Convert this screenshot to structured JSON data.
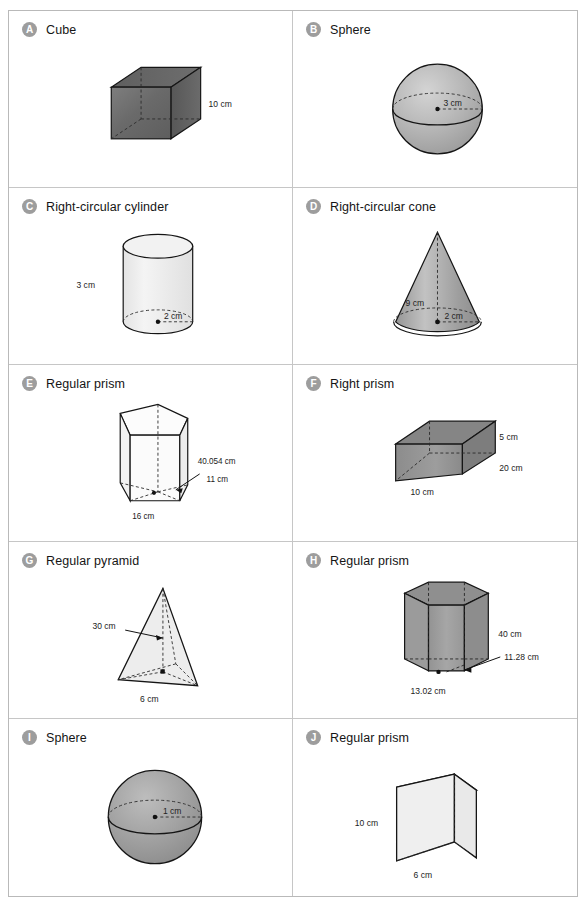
{
  "page": {
    "columns": 2,
    "rows": 5,
    "cell_count": 10
  },
  "cells": [
    {
      "badge": "A",
      "title": "Cube",
      "shape": "cube",
      "fill": "#6f6f6f",
      "labels": [
        {
          "name": "edge-length",
          "text": "10 cm"
        }
      ]
    },
    {
      "badge": "B",
      "title": "Sphere",
      "shape": "sphere",
      "fill": "#b0b0b0",
      "labels": [
        {
          "name": "radius",
          "text": "3 cm"
        }
      ]
    },
    {
      "badge": "C",
      "title": "Right-circular cylinder",
      "shape": "cylinder",
      "fill": "#f0f0f0",
      "labels": [
        {
          "name": "height",
          "text": "3 cm"
        },
        {
          "name": "radius",
          "text": "2 cm"
        }
      ]
    },
    {
      "badge": "D",
      "title": "Right-circular cone",
      "shape": "cone",
      "fill": "#a8a8a8",
      "labels": [
        {
          "name": "height",
          "text": "9 cm"
        },
        {
          "name": "radius",
          "text": "2 cm"
        }
      ]
    },
    {
      "badge": "E",
      "title": "Regular prism",
      "shape": "pentagonal-prism",
      "fill": "#fbfbfb",
      "labels": [
        {
          "name": "height",
          "text": "40.054 cm"
        },
        {
          "name": "apothem",
          "text": "11 cm"
        },
        {
          "name": "base-edge",
          "text": "16 cm"
        }
      ]
    },
    {
      "badge": "F",
      "title": "Right prism",
      "shape": "rectangular-prism",
      "fill": "#8a8a8a",
      "labels": [
        {
          "name": "height",
          "text": "5 cm"
        },
        {
          "name": "depth",
          "text": "20 cm"
        },
        {
          "name": "width",
          "text": "10 cm"
        }
      ]
    },
    {
      "badge": "G",
      "title": "Regular pyramid",
      "shape": "triangular-pyramid",
      "fill": "#ededed",
      "labels": [
        {
          "name": "slant-height",
          "text": "30 cm"
        },
        {
          "name": "base-edge",
          "text": "6 cm"
        }
      ]
    },
    {
      "badge": "H",
      "title": "Regular prism",
      "shape": "hexagonal-prism",
      "fill": "#9c9c9c",
      "labels": [
        {
          "name": "height",
          "text": "40 cm"
        },
        {
          "name": "apothem",
          "text": "11.28 cm"
        },
        {
          "name": "base-edge",
          "text": "13.02 cm"
        }
      ]
    },
    {
      "badge": "I",
      "title": "Sphere",
      "shape": "sphere",
      "fill": "#9a9a9a",
      "labels": [
        {
          "name": "radius",
          "text": "1 cm"
        }
      ]
    },
    {
      "badge": "J",
      "title": "Regular prism",
      "shape": "triangular-prism",
      "fill": "#efefef",
      "labels": [
        {
          "name": "height",
          "text": "10 cm"
        },
        {
          "name": "base-edge",
          "text": "6 cm"
        }
      ]
    }
  ]
}
